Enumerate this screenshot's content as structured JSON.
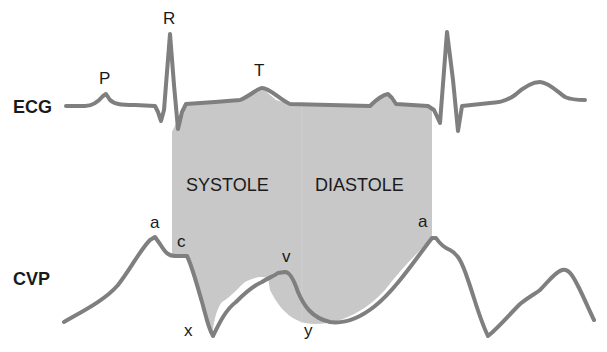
{
  "diagram": {
    "colors": {
      "background": "#ffffff",
      "shade": "#c8c8c8",
      "trace": "#7f7f7f",
      "text": "#1a1a1a"
    },
    "rows": {
      "ecg": "ECG",
      "cvp": "CVP"
    },
    "phases": {
      "systole": "SYSTOLE",
      "diastole": "DIASTOLE"
    },
    "ecg_waves": {
      "p": "P",
      "r": "R",
      "t": "T"
    },
    "cvp_waves": {
      "a1": "a",
      "c": "c",
      "x": "x",
      "v": "v",
      "y": "y",
      "a2": "a"
    }
  }
}
